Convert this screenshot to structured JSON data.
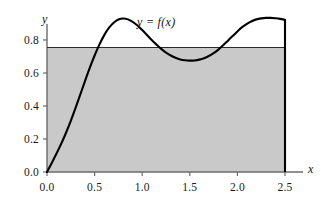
{
  "chart_data": {
    "type": "line",
    "title": "",
    "subtitle": "",
    "xlabel": "x",
    "ylabel": "y",
    "xlim": [
      0.0,
      2.6
    ],
    "ylim": [
      0.0,
      0.98
    ],
    "grid": false,
    "legend_position": "none",
    "curve_label": "y = f(x)",
    "x_ticks": [
      "0.0",
      "0.5",
      "1.0",
      "1.5",
      "2.0",
      "2.5"
    ],
    "x_tick_values": [
      0.0,
      0.5,
      1.0,
      1.5,
      2.0,
      2.5
    ],
    "y_ticks": [
      "0.0",
      "0.2",
      "0.4",
      "0.6",
      "0.8"
    ],
    "y_tick_values": [
      0.0,
      0.2,
      0.4,
      0.6,
      0.8
    ],
    "series": [
      {
        "name": "f(x)",
        "color": "#000000",
        "x": [
          0.0,
          0.05,
          0.1,
          0.15,
          0.2,
          0.25,
          0.3,
          0.35,
          0.4,
          0.45,
          0.5,
          0.55,
          0.6,
          0.65,
          0.7,
          0.75,
          0.8,
          0.85,
          0.9,
          0.95,
          1.0,
          1.05,
          1.1,
          1.15,
          1.2,
          1.25,
          1.3,
          1.35,
          1.4,
          1.45,
          1.5,
          1.55,
          1.6,
          1.65,
          1.7,
          1.75,
          1.8,
          1.85,
          1.9,
          1.95,
          2.0,
          2.05,
          2.1,
          2.15,
          2.2,
          2.25,
          2.3,
          2.35,
          2.4,
          2.45,
          2.5
        ],
        "y": [
          0.0,
          0.055,
          0.112,
          0.172,
          0.238,
          0.31,
          0.388,
          0.47,
          0.552,
          0.632,
          0.706,
          0.772,
          0.828,
          0.873,
          0.905,
          0.924,
          0.93,
          0.925,
          0.91,
          0.888,
          0.86,
          0.83,
          0.8,
          0.772,
          0.746,
          0.724,
          0.706,
          0.692,
          0.682,
          0.677,
          0.675,
          0.676,
          0.681,
          0.69,
          0.703,
          0.72,
          0.742,
          0.768,
          0.796,
          0.824,
          0.852,
          0.878,
          0.898,
          0.914,
          0.925,
          0.931,
          0.934,
          0.934,
          0.932,
          0.928,
          0.922
        ]
      }
    ],
    "annotations": [
      {
        "name": "horizontal-reference-line",
        "type": "hline",
        "y": 0.755,
        "color": "#000000"
      },
      {
        "name": "shaded-region",
        "type": "rect",
        "x0": 0.0,
        "x1": 2.5,
        "y0": 0.0,
        "y1": 0.755,
        "color": "#c9c9c9"
      },
      {
        "name": "right-boundary-line",
        "type": "vline",
        "x": 2.5,
        "y0": 0.0,
        "y1": 0.922,
        "color": "#000000"
      }
    ]
  },
  "colors": {
    "curve": "#000000",
    "fill": "#c9c9c9",
    "axis": "#6b6b6b",
    "text": "#1a1a1a",
    "background": "#ffffff"
  }
}
